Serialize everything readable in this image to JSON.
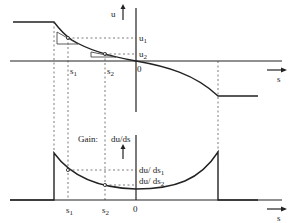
{
  "top_plot": {
    "y_axis_label": "u",
    "x_axis_label": "s",
    "origin_label": "0",
    "markers": {
      "s1": "s",
      "s1_sub": "1",
      "s2": "s",
      "s2_sub": "2"
    },
    "levels": {
      "u1": "u",
      "u1_sub": "1",
      "u2": "u",
      "u2_sub": "2"
    }
  },
  "bottom_plot": {
    "title": "Gain:",
    "y_axis_label": "du/ds",
    "x_axis_label": "s",
    "origin_label": "0",
    "markers": {
      "s1": "s",
      "s1_sub": "1",
      "s2": "s",
      "s2_sub": "2"
    },
    "levels": {
      "g1": "du/ ds",
      "g1_sub": "1",
      "g2": "du/ ds",
      "g2_sub": "2"
    }
  },
  "colors": {
    "ink": "#222222",
    "background": "#ffffff"
  }
}
